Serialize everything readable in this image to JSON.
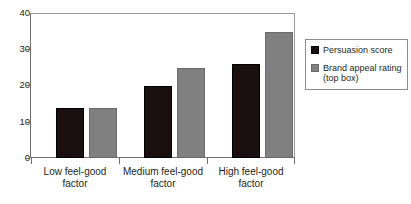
{
  "chart_data": {
    "type": "bar",
    "title": "",
    "xlabel": "",
    "ylabel": "",
    "ylim": [
      0,
      40
    ],
    "yticks": [
      0,
      10,
      20,
      30,
      40
    ],
    "grid": false,
    "legend_position": "right",
    "categories": [
      "Low feel-good factor",
      "Medium feel-good factor",
      "High feel-good factor"
    ],
    "series": [
      {
        "name": "Persuasion score",
        "color": "#1a0f0f",
        "values": [
          14,
          20,
          26
        ]
      },
      {
        "name": "Brand appeal rating (top box)",
        "color": "#808080",
        "values": [
          14,
          25,
          35
        ]
      }
    ]
  },
  "axis": {
    "y_tick_labels": [
      "0",
      "10",
      "20",
      "30",
      "40"
    ]
  },
  "legend": {
    "entries": [
      {
        "label": "Persuasion score"
      },
      {
        "label": "Brand appeal rating (top box)"
      }
    ]
  },
  "footer": {
    "note": ""
  },
  "colors": {
    "series_dark": "#1a0f0f",
    "series_grey": "#808080",
    "frame": "#6e6e6e",
    "text": "#231f20"
  }
}
